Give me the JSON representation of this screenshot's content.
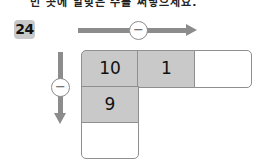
{
  "header": {
    "cut_off_text": "빈 곳에 알맞은 수를 써넣으세요."
  },
  "problem": {
    "number": "24",
    "horizontal_operator": "−",
    "vertical_operator": "−",
    "grid": {
      "row1": [
        "10",
        "1",
        ""
      ],
      "col1": [
        "10",
        "9",
        ""
      ]
    },
    "colors": {
      "shaded": "#c9c9c9",
      "arrow": "#8c8c8c",
      "border": "#8f8f8f"
    }
  }
}
